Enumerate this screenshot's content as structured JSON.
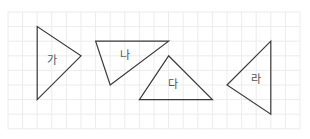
{
  "diagram": {
    "type": "grid-triangles",
    "grid": {
      "columns": 20,
      "rows": 8
    },
    "shapes": [
      {
        "id": "ga",
        "label": "가",
        "vertices_grid": [
          [
            2,
            1
          ],
          [
            2,
            6
          ],
          [
            5,
            3
          ]
        ]
      },
      {
        "id": "na",
        "label": "나",
        "vertices_grid": [
          [
            6,
            2
          ],
          [
            11,
            2
          ],
          [
            7,
            5
          ]
        ]
      },
      {
        "id": "da",
        "label": "다",
        "vertices_grid": [
          [
            11,
            3
          ],
          [
            9,
            6
          ],
          [
            14,
            6
          ]
        ]
      },
      {
        "id": "ra",
        "label": "라",
        "vertices_grid": [
          [
            18,
            2
          ],
          [
            18,
            7
          ],
          [
            15,
            5
          ]
        ]
      }
    ],
    "colors": {
      "grid": "#ececec",
      "stroke": "#3a3a3a",
      "label": "#555555"
    }
  }
}
